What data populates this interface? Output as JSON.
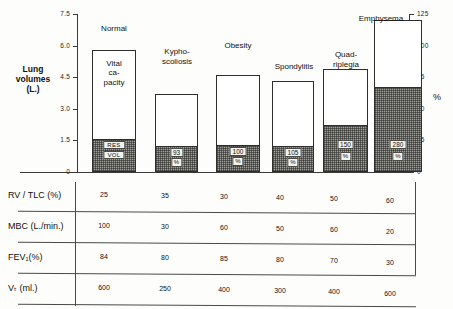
{
  "chart_data": {
    "type": "bar",
    "title": "",
    "subtitle": "",
    "ylabel": "Lung volumes (L.)",
    "ylabel_right": "%",
    "xlabel": "",
    "grid": false,
    "legend": "none",
    "ylim": [
      0,
      7.5
    ],
    "ylim_right": [
      0,
      125
    ],
    "yticks": [
      "0",
      "1.5",
      "3.0",
      "4.5",
      "6.0",
      "7.5"
    ],
    "ytick_values": [
      0,
      1.5,
      3.0,
      4.5,
      6.0,
      7.5
    ],
    "yticks_right": [
      "0",
      "25",
      "50",
      "75",
      "100",
      "125"
    ],
    "ytick_values_right": [
      0,
      25,
      50,
      75,
      100,
      125
    ],
    "categories": [
      "Normal",
      "Kypho-\nscoliosis",
      "Obesity",
      "Spondylitis",
      "Quad-\nriplegia",
      "Emphysema"
    ],
    "series": [
      {
        "name": "Residual volume",
        "values": [
          1.5,
          1.2,
          1.25,
          1.2,
          2.2,
          4.0
        ]
      },
      {
        "name": "Vital capacity",
        "values": [
          4.3,
          2.5,
          3.35,
          3.1,
          2.7,
          3.2
        ]
      }
    ],
    "totals": [
      5.8,
      3.7,
      4.6,
      4.3,
      4.9,
      7.2
    ],
    "bar_inner_labels": [
      "RES\nVOL",
      "93",
      "100",
      "105",
      "150",
      "280"
    ],
    "bar_inner_sublabels": [
      "",
      "%",
      "%",
      "%",
      "%",
      "%"
    ],
    "vital_capacity_label": "Vital\nca-\npacity"
  },
  "table": {
    "rows": [
      {
        "label": "RV / TLC (%)",
        "values": [
          "25",
          "35",
          "30",
          "40",
          "50",
          "60"
        ]
      },
      {
        "label": "MBC (L./min.)",
        "values": [
          "100",
          "30",
          "60",
          "50",
          "60",
          "20"
        ]
      },
      {
        "label": "FEV₁(%)",
        "values": [
          "84",
          "80",
          "85",
          "80",
          "70",
          "30"
        ]
      },
      {
        "label": "Vₜ (ml.)",
        "values": [
          "600",
          "250",
          "400",
          "300",
          "400",
          "600"
        ]
      }
    ]
  },
  "colors": {
    "ink": "#1d1d1b",
    "rule": "#4a4a46",
    "bar_outline": "#2e2e2c",
    "bar_fill": "#ffffff",
    "shade_fill": "#9e9e98",
    "page": "#fdfdfb"
  }
}
